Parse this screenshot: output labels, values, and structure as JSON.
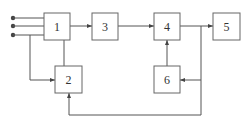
{
  "diagram": {
    "type": "block-diagram",
    "blocks": [
      {
        "id": "1",
        "label": "1"
      },
      {
        "id": "2",
        "label": "2"
      },
      {
        "id": "3",
        "label": "3"
      },
      {
        "id": "4",
        "label": "4"
      },
      {
        "id": "5",
        "label": "5"
      },
      {
        "id": "6",
        "label": "6"
      }
    ],
    "inputs": 3,
    "connections": [
      {
        "from": "inputs",
        "to": "1"
      },
      {
        "from": "input-3",
        "to": "2"
      },
      {
        "from": "1",
        "to": "2"
      },
      {
        "from": "1",
        "to": "3"
      },
      {
        "from": "3",
        "to": "4"
      },
      {
        "from": "6",
        "to": "4"
      },
      {
        "from": "4",
        "to": "5"
      },
      {
        "from": "4-output",
        "to": "6"
      },
      {
        "from": "4-output",
        "to": "2"
      }
    ]
  }
}
